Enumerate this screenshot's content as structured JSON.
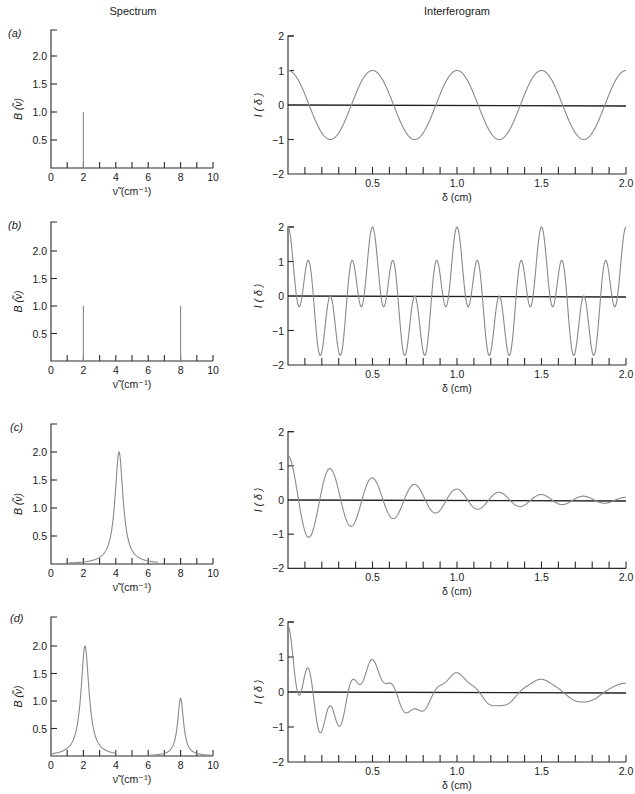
{
  "headers": {
    "spectrum": "Spectrum",
    "interferogram": "Interferogram"
  },
  "panels": [
    {
      "label": "(a)"
    },
    {
      "label": "(b)"
    },
    {
      "label": "(c)"
    },
    {
      "label": "(d)"
    }
  ],
  "colors": {
    "axis": "#2b2b2b",
    "curve": "#8a8a8a",
    "background": "#ffffff"
  },
  "chart_data": [
    {
      "panel": "(a)",
      "role": "spectrum",
      "type": "line",
      "title": "Spectrum",
      "xlabel": "ν̃ (cm⁻¹)",
      "ylabel": "B (ν̃)",
      "xlim": [
        0,
        10
      ],
      "ylim": [
        0,
        2.5
      ],
      "xticks": [
        0,
        1,
        2,
        3,
        4,
        5,
        6,
        7,
        8,
        9,
        10
      ],
      "xticklabels": [
        "0",
        "2",
        "4",
        "6",
        "8",
        "10"
      ],
      "yticks": [
        0.5,
        1.0,
        1.5,
        2.0
      ],
      "yticklabels": [
        "0.5",
        "1.0",
        "1.5",
        "2.0"
      ],
      "lines": [
        {
          "x": 2,
          "height": 1.0
        }
      ],
      "peaks": []
    },
    {
      "panel": "(a)",
      "role": "interferogram",
      "type": "line",
      "title": "Interferogram",
      "xlabel": "δ (cm)",
      "ylabel": "I ( δ )",
      "xlim": [
        0,
        2.0
      ],
      "ylim": [
        -2,
        2
      ],
      "xticklabels": [
        "0.5",
        "1.0",
        "1.5",
        "2.0"
      ],
      "yticklabels": [
        "2",
        "1",
        "0",
        "−1",
        "−2"
      ],
      "model": {
        "components": [
          {
            "amp": 1.0,
            "freq": 2,
            "decay": 0
          }
        ]
      },
      "x": [
        0,
        0.1,
        0.2,
        0.3,
        0.4,
        0.5,
        0.6,
        0.7,
        0.8,
        0.9,
        1.0,
        1.1,
        1.2,
        1.3,
        1.4,
        1.5,
        1.6,
        1.7,
        1.8,
        1.9,
        2.0
      ],
      "y": [
        1,
        0.31,
        -0.81,
        -0.81,
        0.31,
        1,
        0.31,
        -0.81,
        -0.81,
        0.31,
        1,
        0.31,
        -0.81,
        -0.81,
        0.31,
        1,
        0.31,
        -0.81,
        -0.81,
        0.31,
        1
      ]
    },
    {
      "panel": "(b)",
      "role": "spectrum",
      "type": "line",
      "title": "Spectrum",
      "xlabel": "ν̃ (cm⁻¹)",
      "ylabel": "B (ν̃)",
      "xlim": [
        0,
        10
      ],
      "ylim": [
        0,
        2.5
      ],
      "xticks": [
        0,
        1,
        2,
        3,
        4,
        5,
        6,
        7,
        8,
        9,
        10
      ],
      "xticklabels": [
        "0",
        "2",
        "4",
        "6",
        "8",
        "10"
      ],
      "yticks": [
        0.5,
        1.0,
        1.5,
        2.0
      ],
      "yticklabels": [
        "0.5",
        "1.0",
        "1.5",
        "2.0"
      ],
      "lines": [
        {
          "x": 2,
          "height": 1.0
        },
        {
          "x": 8,
          "height": 1.0
        }
      ],
      "peaks": []
    },
    {
      "panel": "(b)",
      "role": "interferogram",
      "type": "line",
      "title": "Interferogram",
      "xlabel": "δ (cm)",
      "ylabel": "I ( δ )",
      "xlim": [
        0,
        2.0
      ],
      "ylim": [
        -2,
        2
      ],
      "xticklabels": [
        "0.5",
        "1.0",
        "1.5",
        "2.0"
      ],
      "yticklabels": [
        "2",
        "1",
        "0",
        "−1",
        "−2"
      ],
      "model": {
        "components": [
          {
            "amp": 1.0,
            "freq": 2,
            "decay": 0
          },
          {
            "amp": 1.0,
            "freq": 8,
            "decay": 0
          }
        ]
      },
      "x": [
        0,
        0.1,
        0.2,
        0.3,
        0.4,
        0.5,
        0.6,
        0.7,
        0.8,
        0.9,
        1.0,
        1.1,
        1.2,
        1.3,
        1.4,
        1.5,
        1.6,
        1.7,
        1.8,
        1.9,
        2.0
      ],
      "y": [
        2,
        0.62,
        -1.62,
        -1.62,
        0.62,
        2,
        0.62,
        -1.62,
        -1.62,
        0.62,
        2,
        0.62,
        -1.62,
        -1.62,
        0.62,
        2,
        0.62,
        -1.62,
        -1.62,
        0.62,
        2
      ]
    },
    {
      "panel": "(c)",
      "role": "spectrum",
      "type": "line",
      "title": "Spectrum",
      "xlabel": "ν̃ (cm⁻¹)",
      "ylabel": "B (ν̃)",
      "xlim": [
        0,
        10
      ],
      "ylim": [
        0,
        2.5
      ],
      "xticks": [
        0,
        1,
        2,
        3,
        4,
        5,
        6,
        7,
        8,
        9,
        10
      ],
      "xticklabels": [
        "0",
        "2",
        "4",
        "6",
        "8",
        "10"
      ],
      "yticks": [
        0.5,
        1.0,
        1.5,
        2.0
      ],
      "yticklabels": [
        "0.5",
        "1.0",
        "1.5",
        "2.0"
      ],
      "lines": [],
      "peaks": [
        {
          "center": 4.2,
          "height": 2.0,
          "halfwidth": 0.3,
          "range": [
            0.9,
            6.6
          ]
        }
      ]
    },
    {
      "panel": "(c)",
      "role": "interferogram",
      "type": "line",
      "title": "Interferogram",
      "xlabel": "δ (cm)",
      "ylabel": "I ( δ )",
      "xlim": [
        0,
        2.0
      ],
      "ylim": [
        -2,
        2
      ],
      "xticklabels": [
        "0.5",
        "1.0",
        "1.5",
        "2.0"
      ],
      "yticklabels": [
        "2",
        "1",
        "0",
        "−1",
        "−2"
      ],
      "model": {
        "components": [
          {
            "amp": 1.3,
            "freq": 4,
            "decay": 1.4
          }
        ]
      },
      "x": [
        0,
        0.1,
        0.2,
        0.3,
        0.4,
        0.5,
        0.6,
        0.7,
        0.8,
        0.9,
        1.0,
        1.1,
        1.2,
        1.3,
        1.4,
        1.5,
        1.6,
        1.7,
        1.8,
        1.9,
        2.0
      ],
      "y": [
        1.3,
        -0.91,
        0.3,
        0.26,
        -0.6,
        0.65,
        -0.45,
        0.15,
        0.13,
        -0.3,
        0.32,
        -0.23,
        0.08,
        0.07,
        -0.15,
        0.16,
        -0.11,
        0.04,
        0.03,
        -0.07,
        0.08
      ]
    },
    {
      "panel": "(d)",
      "role": "spectrum",
      "type": "line",
      "title": "Spectrum",
      "xlabel": "ν̃ (cm⁻¹)",
      "ylabel": "B (ν̃)",
      "xlim": [
        0,
        10
      ],
      "ylim": [
        0,
        2.5
      ],
      "xticks": [
        0,
        1,
        2,
        3,
        4,
        5,
        6,
        7,
        8,
        9,
        10
      ],
      "xticklabels": [
        "0",
        "2",
        "4",
        "6",
        "8",
        "10"
      ],
      "yticks": [
        0.5,
        1.0,
        1.5,
        2.0
      ],
      "yticklabels": [
        "0.5",
        "1.0",
        "1.5",
        "2.0"
      ],
      "lines": [],
      "peaks": [
        {
          "center": 2.1,
          "height": 2.0,
          "halfwidth": 0.3,
          "range": [
            0,
            4.0
          ]
        },
        {
          "center": 8.0,
          "height": 1.05,
          "halfwidth": 0.22,
          "range": [
            6.0,
            10.0
          ]
        }
      ]
    },
    {
      "panel": "(d)",
      "role": "interferogram",
      "type": "line",
      "title": "Interferogram",
      "xlabel": "δ (cm)",
      "ylabel": "I ( δ )",
      "xlim": [
        0,
        2.0
      ],
      "ylim": [
        -2,
        2
      ],
      "xticklabels": [
        "0.5",
        "1.0",
        "1.5",
        "2.0"
      ],
      "yticklabels": [
        "2",
        "1",
        "0",
        "−1",
        "−2"
      ],
      "model": {
        "components": [
          {
            "amp": 1.0,
            "freq": 2,
            "decay": 0.7
          },
          {
            "amp": 0.9,
            "freq": 8,
            "decay": 2.8
          }
        ]
      },
      "x": [
        0,
        0.1,
        0.2,
        0.3,
        0.4,
        0.5,
        0.6,
        0.7,
        0.8,
        0.9,
        1.0,
        1.1,
        1.2,
        1.3,
        1.4,
        1.5,
        1.6,
        1.7,
        1.8,
        1.9,
        2.0
      ],
      "y": [
        1.9,
        0.5,
        -1.12,
        -0.97,
        0.32,
        0.93,
        0.26,
        -0.6,
        -0.54,
        0.19,
        0.55,
        0.16,
        -0.37,
        -0.35,
        0.12,
        0.36,
        0.1,
        -0.25,
        -0.23,
        0.08,
        0.25
      ]
    }
  ]
}
